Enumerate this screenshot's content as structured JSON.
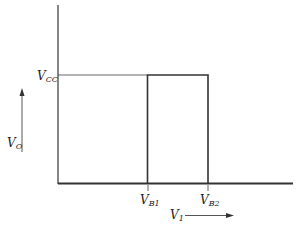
{
  "diagram": {
    "type": "transfer-characteristic",
    "y_axis": {
      "label": "V",
      "label_sub": "O"
    },
    "x_axis": {
      "label": "V",
      "label_sub": "1"
    },
    "levels": [
      {
        "label": "V",
        "label_sub": "CC"
      }
    ],
    "thresholds": [
      {
        "label": "V",
        "label_sub": "B1"
      },
      {
        "label": "V",
        "label_sub": "B2"
      }
    ],
    "colors": {
      "line": "#333333",
      "background": "#ffffff"
    }
  }
}
